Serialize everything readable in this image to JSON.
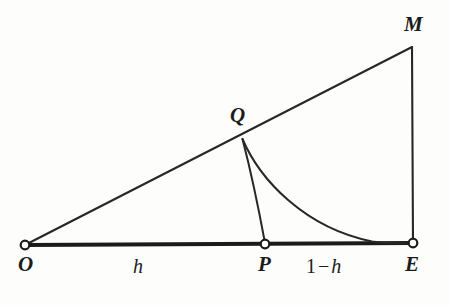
{
  "figure": {
    "background_color": "#fdfdfc",
    "stroke_color": "#1b1b1b",
    "marker_fill": "#ffffff"
  },
  "points": [
    {
      "id": "O",
      "label": "O",
      "x": 25,
      "y": 245,
      "marker": "open-circle"
    },
    {
      "id": "P",
      "label": "P",
      "x": 265,
      "y": 244,
      "marker": "open-circle"
    },
    {
      "id": "E",
      "label": "E",
      "x": 413,
      "y": 243,
      "marker": "open-circle"
    },
    {
      "id": "Q",
      "label": "Q",
      "x": 242,
      "y": 139,
      "marker": "none"
    },
    {
      "id": "M",
      "label": "M",
      "x": 412,
      "y": 47,
      "marker": "none"
    }
  ],
  "segment_labels": [
    {
      "id": "h",
      "text": "h",
      "between": "O-P",
      "x": 140,
      "y": 265
    },
    {
      "id": "one-h",
      "number": "1",
      "operator": "−",
      "variable": "h",
      "between": "P-E",
      "x": 335,
      "y": 265
    }
  ],
  "edges": [
    {
      "id": "baseline-OE",
      "from": "O",
      "to": "E",
      "kind": "straight",
      "weight": "thick"
    },
    {
      "id": "hypotenuse-OM",
      "from": "O",
      "to": "M",
      "kind": "straight",
      "weight": "thin"
    },
    {
      "id": "vertical-ME",
      "from": "M",
      "to": "E",
      "kind": "straight",
      "weight": "thin"
    },
    {
      "id": "curve-QP",
      "from": "Q",
      "to": "P",
      "kind": "curve",
      "weight": "thin"
    },
    {
      "id": "curve-QE",
      "from": "Q",
      "to": "E",
      "kind": "curve",
      "weight": "thin"
    }
  ]
}
